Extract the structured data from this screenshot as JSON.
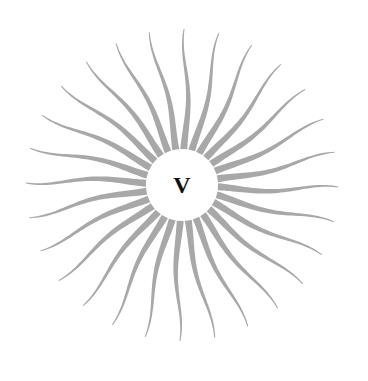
{
  "emblem": {
    "letter": "V",
    "center": {
      "x": 182,
      "y": 185
    },
    "inner_radius": 36,
    "ray_count": 28,
    "ray_length": 120,
    "ray_width": 7,
    "colors": {
      "ray": "#a8a8a8",
      "letter": "#111111",
      "background": "#ffffff"
    }
  }
}
